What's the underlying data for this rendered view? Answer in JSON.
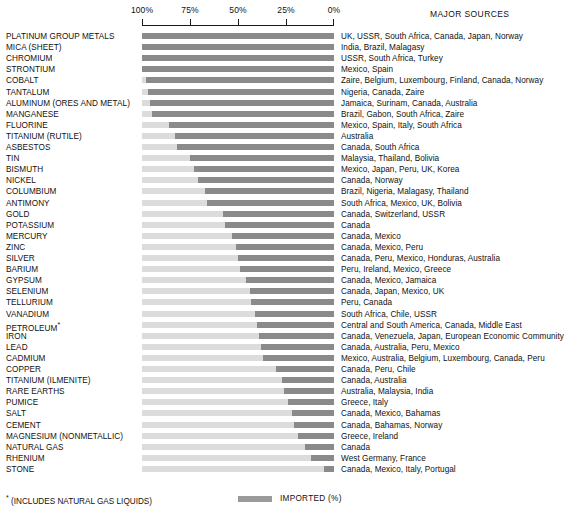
{
  "axis": {
    "ticks": [
      "100%",
      "75%",
      "50%",
      "25%",
      "0%"
    ],
    "tick_values": [
      100,
      75,
      50,
      25,
      0
    ],
    "direction": "right-to-left"
  },
  "headers": {
    "major_sources": "MAJOR SOURCES"
  },
  "legend": {
    "label": "IMPORTED (%)",
    "swatch_color": "#9a9a9a"
  },
  "footnote": {
    "marker": "*",
    "text": "(INCLUDES NATURAL GAS LIQUIDS)"
  },
  "colors": {
    "imported_bar": "#8a8a8a",
    "domestic_bar": "#dcdcdc",
    "text": "#111111",
    "axis": "#1a1a1a"
  },
  "chart_data": {
    "type": "bar",
    "title": "",
    "subtitle": "",
    "xlabel": "",
    "ylabel": "",
    "xlim": [
      100,
      0
    ],
    "grid": false,
    "legend_position": "bottom-right",
    "orientation": "horizontal",
    "categories": [
      "PLATINUM GROUP METALS",
      "MICA (SHEET)",
      "CHROMIUM",
      "STRONTIUM",
      "COBALT",
      "TANTALUM",
      "ALUMINUM (ORES AND METAL)",
      "MANGANESE",
      "FLUORINE",
      "TITANIUM (RUTILE)",
      "ASBESTOS",
      "TIN",
      "BISMUTH",
      "NICKEL",
      "COLUMBIUM",
      "ANTIMONY",
      "GOLD",
      "POTASSIUM",
      "MERCURY",
      "ZINC",
      "SILVER",
      "BARIUM",
      "GYPSUM",
      "SELENIUM",
      "TELLURIUM",
      "VANADIUM",
      "PETROLEUM",
      "IRON",
      "LEAD",
      "CADMIUM",
      "COPPER",
      "TITANIUM (ILMENITE)",
      "RARE EARTHS",
      "PUMICE",
      "SALT",
      "CEMENT",
      "MAGNESIUM (NONMETALLIC)",
      "NATURAL GAS",
      "RHENIUM",
      "STONE"
    ],
    "values": [
      100,
      100,
      100,
      100,
      98,
      97,
      96,
      95,
      86,
      83,
      82,
      75,
      73,
      71,
      67,
      66,
      58,
      57,
      53,
      51,
      50,
      49,
      46,
      44,
      43,
      41,
      40,
      39,
      38,
      37,
      30,
      27,
      26,
      24,
      22,
      21,
      19,
      15,
      12,
      5
    ],
    "series": [
      {
        "name": "IMPORTED (%)",
        "values": [
          100,
          100,
          100,
          100,
          98,
          97,
          96,
          95,
          86,
          83,
          82,
          75,
          73,
          71,
          67,
          66,
          58,
          57,
          53,
          51,
          50,
          49,
          46,
          44,
          43,
          41,
          40,
          39,
          38,
          37,
          30,
          27,
          26,
          24,
          22,
          21,
          19,
          15,
          12,
          5
        ]
      }
    ]
  },
  "rows": [
    {
      "name": "PLATINUM GROUP METALS",
      "note": "",
      "imported": 100,
      "sources": "UK, USSR, South Africa, Canada, Japan, Norway"
    },
    {
      "name": "MICA (SHEET)",
      "note": "",
      "imported": 100,
      "sources": "India, Brazil, Malagasy"
    },
    {
      "name": "CHROMIUM",
      "note": "",
      "imported": 100,
      "sources": "USSR, South Africa, Turkey"
    },
    {
      "name": "STRONTIUM",
      "note": "",
      "imported": 100,
      "sources": "Mexico, Spain"
    },
    {
      "name": "COBALT",
      "note": "",
      "imported": 98,
      "sources": "Zaire, Belgium, Luxembourg, Finland, Canada, Norway"
    },
    {
      "name": "TANTALUM",
      "note": "",
      "imported": 97,
      "sources": "Nigeria, Canada, Zaire"
    },
    {
      "name": "ALUMINUM (ORES AND METAL)",
      "note": "",
      "imported": 96,
      "sources": "Jamaica, Surinam, Canada, Australia"
    },
    {
      "name": "MANGANESE",
      "note": "",
      "imported": 95,
      "sources": "Brazil, Gabon, South Africa, Zaire"
    },
    {
      "name": "FLUORINE",
      "note": "",
      "imported": 86,
      "sources": "Mexico, Spain, Italy, South Africa"
    },
    {
      "name": "TITANIUM (RUTILE)",
      "note": "",
      "imported": 83,
      "sources": "Australia"
    },
    {
      "name": "ASBESTOS",
      "note": "",
      "imported": 82,
      "sources": "Canada, South Africa"
    },
    {
      "name": "TIN",
      "note": "",
      "imported": 75,
      "sources": "Malaysia, Thailand, Bolivia"
    },
    {
      "name": "BISMUTH",
      "note": "",
      "imported": 73,
      "sources": "Mexico, Japan, Peru, UK, Korea"
    },
    {
      "name": "NICKEL",
      "note": "",
      "imported": 71,
      "sources": "Canada, Norway"
    },
    {
      "name": "COLUMBIUM",
      "note": "",
      "imported": 67,
      "sources": "Brazil, Nigeria, Malagasy, Thailand"
    },
    {
      "name": "ANTIMONY",
      "note": "",
      "imported": 66,
      "sources": "South Africa, Mexico, UK, Bolivia"
    },
    {
      "name": "GOLD",
      "note": "",
      "imported": 58,
      "sources": "Canada, Switzerland, USSR"
    },
    {
      "name": "POTASSIUM",
      "note": "",
      "imported": 57,
      "sources": "Canada"
    },
    {
      "name": "MERCURY",
      "note": "",
      "imported": 53,
      "sources": "Canada, Mexico"
    },
    {
      "name": "ZINC",
      "note": "",
      "imported": 51,
      "sources": "Canada, Mexico, Peru"
    },
    {
      "name": "SILVER",
      "note": "",
      "imported": 50,
      "sources": "Canada, Peru, Mexico, Honduras, Australia"
    },
    {
      "name": "BARIUM",
      "note": "",
      "imported": 49,
      "sources": "Peru, Ireland, Mexico, Greece"
    },
    {
      "name": "GYPSUM",
      "note": "",
      "imported": 46,
      "sources": "Canada, Mexico, Jamaica"
    },
    {
      "name": "SELENIUM",
      "note": "",
      "imported": 44,
      "sources": "Canada, Japan, Mexico, UK"
    },
    {
      "name": "TELLURIUM",
      "note": "",
      "imported": 43,
      "sources": "Peru, Canada"
    },
    {
      "name": "VANADIUM",
      "note": "",
      "imported": 41,
      "sources": "South Africa, Chile, USSR"
    },
    {
      "name": "PETROLEUM",
      "note": "*",
      "imported": 40,
      "sources": "Central and South America, Canada, Middle East"
    },
    {
      "name": "IRON",
      "note": "",
      "imported": 39,
      "sources": "Canada, Venezuela, Japan, European Economic Community"
    },
    {
      "name": "LEAD",
      "note": "",
      "imported": 38,
      "sources": "Canada, Australia, Peru, Mexico"
    },
    {
      "name": "CADMIUM",
      "note": "",
      "imported": 37,
      "sources": "Mexico, Australia, Belgium, Luxembourg, Canada, Peru"
    },
    {
      "name": "COPPER",
      "note": "",
      "imported": 30,
      "sources": "Canada, Peru, Chile"
    },
    {
      "name": "TITANIUM (ILMENITE)",
      "note": "",
      "imported": 27,
      "sources": "Canada, Australia"
    },
    {
      "name": "RARE EARTHS",
      "note": "",
      "imported": 26,
      "sources": "Australia, Malaysia, India"
    },
    {
      "name": "PUMICE",
      "note": "",
      "imported": 24,
      "sources": "Greece, Italy"
    },
    {
      "name": "SALT",
      "note": "",
      "imported": 22,
      "sources": "Canada, Mexico, Bahamas"
    },
    {
      "name": "CEMENT",
      "note": "",
      "imported": 21,
      "sources": "Canada, Bahamas, Norway"
    },
    {
      "name": "MAGNESIUM (NONMETALLIC)",
      "note": "",
      "imported": 19,
      "sources": "Greece, Ireland"
    },
    {
      "name": "NATURAL GAS",
      "note": "",
      "imported": 15,
      "sources": "Canada"
    },
    {
      "name": "RHENIUM",
      "note": "",
      "imported": 12,
      "sources": "West Germany, France"
    },
    {
      "name": "STONE",
      "note": "",
      "imported": 5,
      "sources": "Canada, Mexico, Italy, Portugal"
    }
  ]
}
